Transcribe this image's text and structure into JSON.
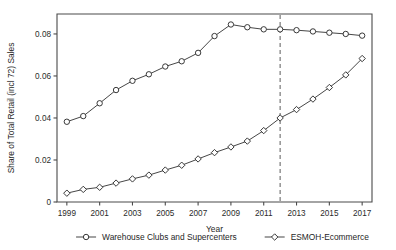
{
  "chart_data": {
    "type": "line",
    "title": "",
    "xlabel": "Year",
    "ylabel": "Share of Total Retail (incl 72) Sales",
    "xlim": [
      1998.4,
      2017.6
    ],
    "ylim": [
      0,
      0.0895
    ],
    "grid": false,
    "legend_position": "below-axis",
    "x_tick_labels": [
      "1999",
      "2001",
      "2003",
      "2005",
      "2007",
      "2009",
      "2011",
      "2013",
      "2015",
      "2017"
    ],
    "x_ticks": [
      1999,
      2001,
      2003,
      2005,
      2007,
      2009,
      2011,
      2013,
      2015,
      2017
    ],
    "y_tick_labels": [
      "0",
      "0.02",
      "0.04",
      "0.06",
      "0.08"
    ],
    "y_ticks": [
      0,
      0.02,
      0.04,
      0.06,
      0.08
    ],
    "annotations": [
      {
        "type": "vertical-dashed-line",
        "x": 2012,
        "label": ""
      }
    ],
    "x": [
      1999,
      2000,
      2001,
      2002,
      2003,
      2004,
      2005,
      2006,
      2007,
      2008,
      2009,
      2010,
      2011,
      2012,
      2013,
      2014,
      2015,
      2016,
      2017
    ],
    "series": [
      {
        "name": "Warehouse Clubs and Supercenters",
        "marker": "circle",
        "values": [
          0.0382,
          0.0409,
          0.047,
          0.0533,
          0.0577,
          0.0608,
          0.0645,
          0.067,
          0.071,
          0.079,
          0.0845,
          0.0832,
          0.0822,
          0.0822,
          0.0818,
          0.0812,
          0.0806,
          0.08,
          0.0792
        ]
      },
      {
        "name": "ESMOH-Ecommerce",
        "marker": "diamond",
        "values": [
          0.0042,
          0.006,
          0.007,
          0.009,
          0.011,
          0.0128,
          0.0152,
          0.0175,
          0.0205,
          0.0235,
          0.0262,
          0.029,
          0.034,
          0.04,
          0.044,
          0.049,
          0.0545,
          0.0605,
          0.0683
        ]
      }
    ]
  },
  "legend": {
    "items": [
      {
        "label": "Warehouse Clubs and Supercenters",
        "marker": "circle"
      },
      {
        "label": "ESMOH-Ecommerce",
        "marker": "diamond"
      }
    ]
  },
  "colors": {
    "line": "#3c3c3c",
    "marker_fill": "#ffffff",
    "marker_stroke": "#2e2e2e",
    "axis": "#4a4a4a",
    "dashed_line": "#6b6b6b",
    "text": "#1f1f1f",
    "background": "#ffffff"
  }
}
